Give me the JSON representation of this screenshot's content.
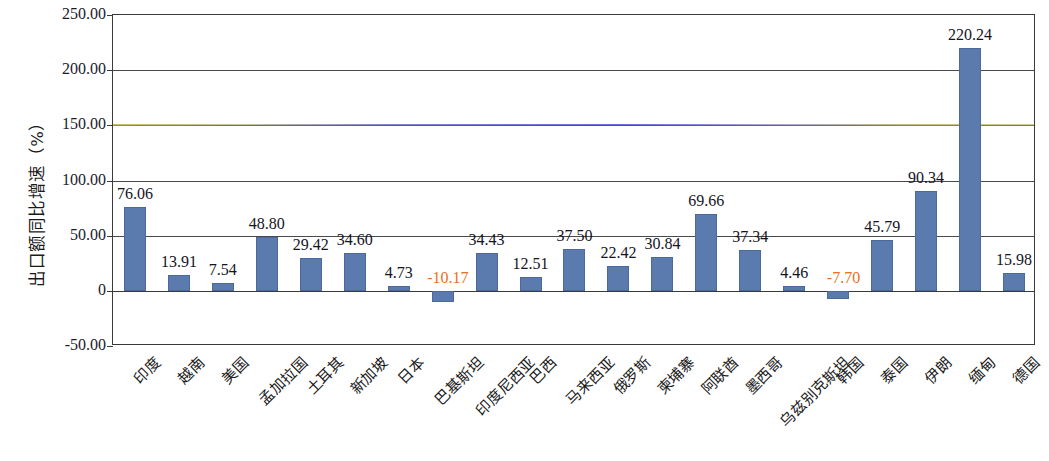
{
  "chart_data": {
    "type": "bar",
    "title": "",
    "subtitle": "",
    "xlabel": "",
    "ylabel": "出口额同比增速（%）",
    "ylim": [
      -50,
      250
    ],
    "ytick_values": [
      250,
      200,
      150,
      100,
      50,
      0,
      -50
    ],
    "ytick_labels": [
      "250.00",
      "200.00",
      "150.00",
      "100.00",
      "50.00",
      "0",
      "-50.00"
    ],
    "grid": true,
    "legend": null,
    "bar_color": "#5b7aad",
    "negative_label_color": "#e8701a",
    "categories": [
      "印度",
      "越南",
      "美国",
      "孟加拉国",
      "土耳其",
      "新加坡",
      "日本",
      "巴基斯坦",
      "印度尼西亚",
      "巴西",
      "马来西亚",
      "俄罗斯",
      "柬埔寨",
      "阿联酋",
      "墨西哥",
      "乌兹别克斯坦",
      "韩国",
      "泰国",
      "伊朗",
      "缅甸",
      "德国"
    ],
    "values": [
      76.06,
      13.91,
      7.54,
      48.8,
      29.42,
      34.6,
      4.73,
      -10.17,
      34.43,
      12.51,
      37.5,
      22.42,
      30.84,
      69.66,
      37.34,
      4.46,
      -7.7,
      45.79,
      90.34,
      220.24,
      15.98
    ],
    "value_labels": [
      "76.06",
      "13.91",
      "7.54",
      "48.80",
      "29.42",
      "34.60",
      "4.73",
      "-10.17",
      "34.43",
      "12.51",
      "37.50",
      "22.42",
      "30.84",
      "69.66",
      "37.34",
      "4.46",
      "-7.70",
      "45.79",
      "90.34",
      "220.24",
      "15.98"
    ]
  }
}
